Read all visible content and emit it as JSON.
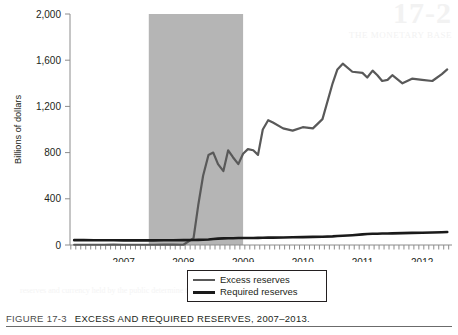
{
  "figure": {
    "caption_number": "FIGURE 17-3",
    "caption_title": "EXCESS AND REQUIRED RESERVES, 2007–2013."
  },
  "bleed_through": {
    "number": "17-2",
    "subtitle": "THE MONETARY BASE",
    "body": "reserves and currency held by the public determine the monetary base"
  },
  "legend": {
    "excess_label": "Excess reserves",
    "required_label": "Required reserves"
  },
  "colors": {
    "excess_line": "#595959",
    "required_line": "#1a1a1a",
    "recession_band": "#b5b5b5",
    "axis": "#8c8c8c",
    "text": "#231f20"
  },
  "chart_data": {
    "type": "line",
    "title": "EXCESS AND REQUIRED RESERVES, 2007–2013",
    "xlabel": "",
    "ylabel": "Billions of dollars",
    "ylim": [
      0,
      2000
    ],
    "yticks": [
      0,
      400,
      800,
      1200,
      1600,
      2000
    ],
    "ytick_labels": [
      "0",
      "400",
      "800",
      "1,200",
      "1,600",
      "2,000"
    ],
    "xlim": [
      2006.6,
      2013.0
    ],
    "xticks": [
      2007,
      2008,
      2009,
      2010,
      2011,
      2012
    ],
    "xtick_labels": [
      "2007",
      "2008",
      "2009",
      "2010",
      "2011",
      "2012"
    ],
    "minor_tick_interval_years": 0.0833,
    "grid": false,
    "legend_position": "bottom-center",
    "shaded_regions": [
      {
        "label": "recession",
        "x_start": 2007.92,
        "x_end": 2009.5,
        "color": "#b5b5b5"
      }
    ],
    "x": [
      2006.67,
      2006.83,
      2007.0,
      2007.17,
      2007.33,
      2007.5,
      2007.67,
      2007.83,
      2008.0,
      2008.17,
      2008.33,
      2008.5,
      2008.67,
      2008.75,
      2008.83,
      2008.92,
      2009.0,
      2009.08,
      2009.17,
      2009.25,
      2009.33,
      2009.42,
      2009.5,
      2009.58,
      2009.67,
      2009.75,
      2009.83,
      2009.92,
      2010.0,
      2010.17,
      2010.33,
      2010.5,
      2010.67,
      2010.83,
      2011.0,
      2011.08,
      2011.17,
      2011.33,
      2011.5,
      2011.58,
      2011.67,
      2011.75,
      2011.83,
      2011.92,
      2012.0,
      2012.17,
      2012.33,
      2012.5,
      2012.67,
      2012.83,
      2012.92
    ],
    "series": [
      {
        "name": "Excess reserves",
        "color": "#595959",
        "values": [
          2,
          2,
          2,
          2,
          3,
          2,
          2,
          2,
          2,
          3,
          3,
          2,
          60,
          350,
          600,
          780,
          800,
          700,
          640,
          820,
          760,
          700,
          790,
          830,
          820,
          780,
          1000,
          1080,
          1060,
          1010,
          990,
          1020,
          1010,
          1090,
          1400,
          1520,
          1570,
          1500,
          1490,
          1450,
          1510,
          1470,
          1420,
          1430,
          1470,
          1400,
          1440,
          1430,
          1420,
          1480,
          1520
        ]
      },
      {
        "name": "Required reserves",
        "color": "#1a1a1a",
        "values": [
          42,
          42,
          41,
          41,
          41,
          40,
          40,
          40,
          40,
          41,
          41,
          42,
          43,
          44,
          45,
          47,
          52,
          55,
          57,
          58,
          59,
          60,
          60,
          61,
          61,
          62,
          63,
          64,
          64,
          65,
          67,
          68,
          70,
          72,
          75,
          78,
          80,
          85,
          92,
          95,
          97,
          98,
          99,
          100,
          101,
          103,
          105,
          106,
          108,
          110,
          112
        ]
      }
    ]
  }
}
